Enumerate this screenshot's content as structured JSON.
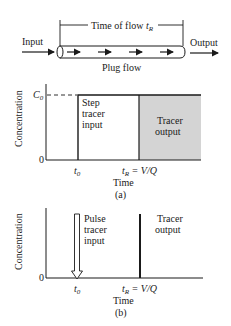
{
  "top_diagram": {
    "input_label": "Input",
    "output_label": "Output",
    "time_of_flow_label": "Time of flow ",
    "time_of_flow_symbol": "t",
    "time_of_flow_subscript": "R",
    "pipe_label": "Plug flow",
    "flow_arrows": 4
  },
  "chart_a": {
    "caption": "(a)",
    "ylabel": "Concentration",
    "xlabel": "Time",
    "y_ticks": [
      "C",
      "0"
    ],
    "c0_symbol": "C",
    "c0_subscript": "0",
    "zero_label": "0",
    "t0_symbol": "t",
    "t0_subscript": "0",
    "tr_symbol": "t",
    "tr_subscript": "R",
    "tr_equation": " = V/Q",
    "input_label_lines": [
      "Step",
      "tracer",
      "input"
    ],
    "output_label_lines": [
      "Tracer",
      "output"
    ],
    "output_fill": "#d4d4d4"
  },
  "chart_b": {
    "caption": "(b)",
    "ylabel": "Concentration",
    "xlabel": "Time",
    "zero_label": "0",
    "t0_symbol": "t",
    "t0_subscript": "0",
    "tr_symbol": "t",
    "tr_subscript": "R",
    "tr_equation": " = V/Q",
    "input_label_lines": [
      "Pulse",
      "tracer",
      "input"
    ],
    "output_label_lines": [
      "Tracer",
      "output"
    ]
  }
}
